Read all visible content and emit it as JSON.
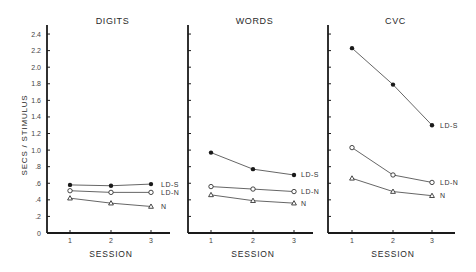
{
  "chart_data": {
    "type": "line",
    "ylabel": "SECS / STIMULUS",
    "xlabel": "SESSION",
    "ylim": [
      0,
      2.4
    ],
    "yticks": [
      0,
      0.2,
      0.4,
      0.6,
      0.8,
      1.0,
      1.2,
      1.4,
      1.6,
      1.8,
      2.0,
      2.2,
      2.4
    ],
    "ytick_labels": [
      "0",
      ".2",
      ".4",
      ".6",
      ".8",
      "1.0",
      "1.2",
      "1.4",
      "1.6",
      "1.8",
      "2.0",
      "2.2",
      "2.4"
    ],
    "x": [
      1,
      2,
      3
    ],
    "x_tick_labels": [
      "1",
      "2",
      "3"
    ],
    "grid": false,
    "legend_position": "inline-right-of-lines",
    "panels": [
      {
        "title": "DIGITS",
        "series": [
          {
            "name": "LD-S",
            "marker": "filled-circle",
            "values": [
              0.58,
              0.57,
              0.59
            ]
          },
          {
            "name": "LD-N",
            "marker": "open-circle",
            "values": [
              0.51,
              0.49,
              0.49
            ]
          },
          {
            "name": "N",
            "marker": "open-triangle",
            "values": [
              0.42,
              0.36,
              0.32
            ]
          }
        ]
      },
      {
        "title": "WORDS",
        "series": [
          {
            "name": "LD-S",
            "marker": "filled-circle",
            "values": [
              0.97,
              0.77,
              0.7
            ]
          },
          {
            "name": "LD-N",
            "marker": "open-circle",
            "values": [
              0.56,
              0.53,
              0.5
            ]
          },
          {
            "name": "N",
            "marker": "open-triangle",
            "values": [
              0.46,
              0.39,
              0.36
            ]
          }
        ]
      },
      {
        "title": "CVC",
        "series": [
          {
            "name": "LD-S",
            "marker": "filled-circle",
            "values": [
              2.23,
              1.79,
              1.3
            ]
          },
          {
            "name": "LD-N",
            "marker": "open-circle",
            "values": [
              1.03,
              0.7,
              0.61
            ]
          },
          {
            "name": "N",
            "marker": "open-triangle",
            "values": [
              0.66,
              0.5,
              0.45
            ]
          }
        ]
      }
    ]
  },
  "layout": {
    "baseline_y": 233,
    "px_per_unit": 82.9,
    "axis_top_y": 25,
    "panels": [
      {
        "axis_x": 47,
        "axis_end_x": 170,
        "x_ticks": [
          70,
          111,
          151
        ],
        "label_x": 161
      },
      {
        "axis_x": 188,
        "axis_end_x": 313,
        "x_ticks": [
          211,
          253,
          294
        ],
        "label_x": 301
      },
      {
        "axis_x": 328,
        "axis_end_x": 455,
        "x_ticks": [
          352,
          393,
          432
        ],
        "label_x": 440
      }
    ]
  },
  "colors": {
    "axis": "#1a1a1a",
    "line": "#555555",
    "marker": "#1a1a1a",
    "text": "#2a2a2a"
  }
}
